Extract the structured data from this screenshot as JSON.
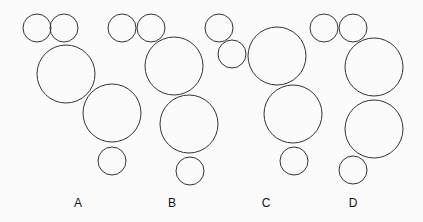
{
  "figure": {
    "stroke_color": "#333333",
    "background": "#fbfbfb",
    "options": [
      {
        "label": "A",
        "label_pos": [
          78,
          207
        ],
        "circles": [
          {
            "cx": 37,
            "cy": 28,
            "r": 14
          },
          {
            "cx": 64,
            "cy": 28,
            "r": 14
          },
          {
            "cx": 66,
            "cy": 74,
            "r": 29
          },
          {
            "cx": 112,
            "cy": 113,
            "r": 29
          },
          {
            "cx": 112,
            "cy": 161,
            "r": 14
          }
        ]
      },
      {
        "label": "B",
        "label_pos": [
          172,
          207
        ],
        "circles": [
          {
            "cx": 122,
            "cy": 28,
            "r": 14
          },
          {
            "cx": 151,
            "cy": 28,
            "r": 14
          },
          {
            "cx": 174,
            "cy": 66,
            "r": 29
          },
          {
            "cx": 189,
            "cy": 124,
            "r": 29
          },
          {
            "cx": 190,
            "cy": 171,
            "r": 14
          }
        ]
      },
      {
        "label": "C",
        "label_pos": [
          266,
          207
        ],
        "circles": [
          {
            "cx": 219,
            "cy": 28,
            "r": 14
          },
          {
            "cx": 232,
            "cy": 54,
            "r": 14
          },
          {
            "cx": 277,
            "cy": 56,
            "r": 29
          },
          {
            "cx": 293,
            "cy": 114,
            "r": 29
          },
          {
            "cx": 294,
            "cy": 161,
            "r": 14
          }
        ]
      },
      {
        "label": "D",
        "label_pos": [
          353,
          207
        ],
        "circles": [
          {
            "cx": 324,
            "cy": 28,
            "r": 14
          },
          {
            "cx": 353,
            "cy": 28,
            "r": 14
          },
          {
            "cx": 374,
            "cy": 67,
            "r": 29
          },
          {
            "cx": 374,
            "cy": 129,
            "r": 29
          },
          {
            "cx": 353,
            "cy": 170,
            "r": 14
          }
        ]
      }
    ]
  }
}
